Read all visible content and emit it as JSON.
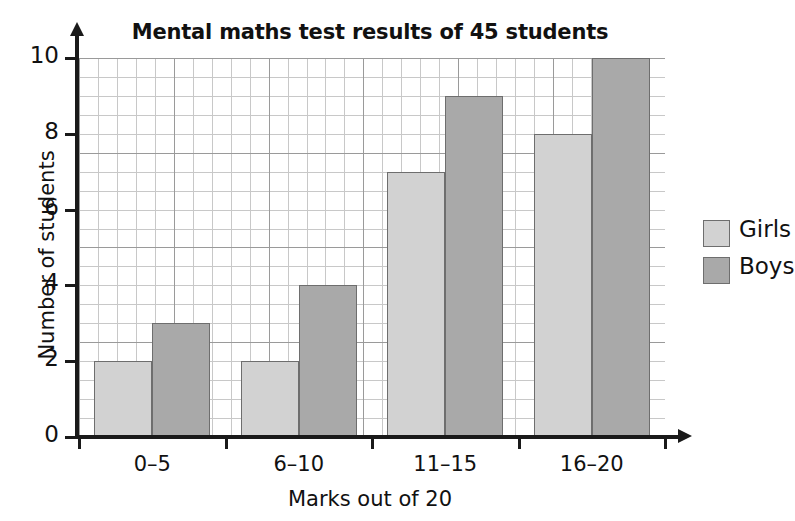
{
  "chart_data": {
    "type": "bar",
    "title": "Mental maths test results of 45 students",
    "xlabel": "Marks out of 20",
    "ylabel": "Number of students",
    "categories": [
      "0–5",
      "6–10",
      "11–15",
      "16–20"
    ],
    "series": [
      {
        "name": "Girls",
        "color": "#d2d2d2",
        "values": [
          2,
          2,
          7,
          8
        ]
      },
      {
        "name": "Boys",
        "color": "#a9a9a9",
        "values": [
          3,
          4,
          9,
          10
        ]
      }
    ],
    "ylim": [
      0,
      10
    ],
    "yticks": [
      0,
      2,
      4,
      6,
      8,
      10
    ],
    "ytick_labels": [
      "0",
      "2",
      "4",
      "6",
      "8",
      "10"
    ],
    "grid": true,
    "grid_minor": true,
    "legend_position": "right"
  },
  "axes": {
    "y_ticks": [
      "0",
      "2",
      "4",
      "6",
      "8",
      "10"
    ],
    "x_ticks": [
      "0–5",
      "6–10",
      "11–15",
      "16–20"
    ]
  },
  "legend": {
    "entries": [
      {
        "label": "Girls"
      },
      {
        "label": "Boys"
      }
    ]
  }
}
